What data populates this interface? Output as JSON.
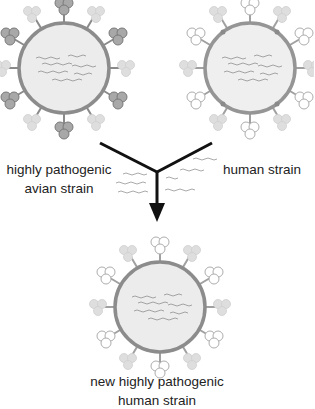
{
  "figure": {
    "type": "reassortment-diagram",
    "colors": {
      "membrane_stroke": "#8c8c8c",
      "membrane_fill": "#ececec",
      "avian_spike_fill": "#a0a0a0",
      "avian_spike_stroke": "#7a7a7a",
      "human_spike_fill": "#ffffff",
      "human_spike_stroke": "#b0b0b0",
      "faint_spike_fill": "#dcdcdc",
      "arrow": "#111111",
      "rna": "#9a9a9a",
      "text": "#222222"
    },
    "viruses": [
      {
        "id": "avian",
        "cx": 64,
        "cy": 68,
        "r": 45,
        "spike_style": "dark"
      },
      {
        "id": "human",
        "cx": 250,
        "cy": 68,
        "r": 45,
        "spike_style": "outline"
      },
      {
        "id": "new",
        "cx": 160,
        "cy": 307,
        "r": 45,
        "spike_style": "outline"
      }
    ],
    "arrow": {
      "left_start": [
        100,
        143
      ],
      "right_start": [
        212,
        143
      ],
      "junction": [
        157,
        172
      ],
      "tip": [
        157,
        222
      ]
    }
  },
  "labels": {
    "avian_line1": "highly pathogenic",
    "avian_line2": "avian strain",
    "human": "human strain",
    "new_line1": "new highly pathogenic",
    "new_line2": "human strain"
  }
}
